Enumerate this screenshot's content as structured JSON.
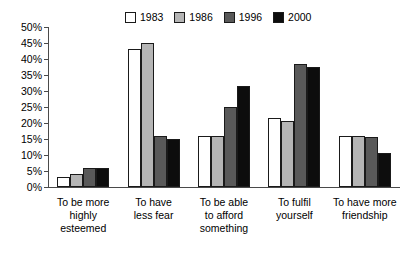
{
  "chart_data": {
    "type": "bar",
    "title": "",
    "subtitle": "",
    "xlabel": "",
    "ylabel": "",
    "ylim": [
      0,
      50
    ],
    "ytick_step": 5,
    "ytick_labels": [
      "0%",
      "5%",
      "10%",
      "15%",
      "20%",
      "25%",
      "30%",
      "35%",
      "40%",
      "45%",
      "50%"
    ],
    "ytick_values": [
      0,
      5,
      10,
      15,
      20,
      25,
      30,
      35,
      40,
      45,
      50
    ],
    "grid": false,
    "legend_position": "top-center",
    "categories": [
      "To be more highly esteemed",
      "To have less fear",
      "To be able to afford something",
      "To fulfil yourself",
      "To have more friendship"
    ],
    "category_label_lines": [
      [
        "To be more",
        "highly",
        "esteemed"
      ],
      [
        "To have",
        "less fear"
      ],
      [
        "To be able",
        "to afford",
        "something"
      ],
      [
        "To fulfil",
        "yourself"
      ],
      [
        "To have more",
        "friendship"
      ]
    ],
    "series": [
      {
        "name": "1983",
        "color": "#ffffff",
        "values": [
          3,
          43,
          16,
          21.5,
          16
        ]
      },
      {
        "name": "1986",
        "color": "#b5b5b5",
        "values": [
          4,
          45,
          16,
          20.5,
          16
        ]
      },
      {
        "name": "1996",
        "color": "#595959",
        "values": [
          6,
          16,
          25,
          38.5,
          15.5
        ]
      },
      {
        "name": "2000",
        "color": "#0d0d0d",
        "values": [
          6,
          15,
          31.5,
          37.5,
          10.5
        ]
      }
    ]
  },
  "legend": {
    "entries": [
      {
        "label": "1983",
        "color": "#ffffff"
      },
      {
        "label": "1986",
        "color": "#b5b5b5"
      },
      {
        "label": "1996",
        "color": "#595959"
      },
      {
        "label": "2000",
        "color": "#0d0d0d"
      }
    ]
  },
  "axis": {
    "outline_color": "#4a4a4a",
    "bar_outline_color": "#1a1a1a"
  }
}
